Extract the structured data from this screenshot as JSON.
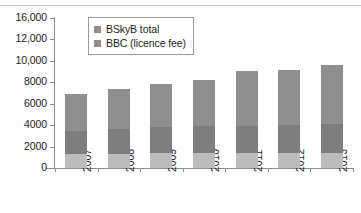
{
  "chart_data": {
    "type": "bar",
    "title": "",
    "subtitle": "",
    "xlabel": "",
    "ylabel": "",
    "stacked": true,
    "grid": false,
    "legend_position": "top-left-inside",
    "ylim": [
      0,
      16000
    ],
    "yticks": [
      0,
      2000,
      4000,
      6000,
      8000,
      10000,
      12000,
      16000
    ],
    "ytick_labels": [
      "0",
      "2000",
      "4000",
      "6000",
      "8000",
      "10,000",
      "12,000",
      "16,000"
    ],
    "categories": [
      "2007",
      "2008",
      "2009",
      "2010",
      "2011",
      "2012",
      "2013"
    ],
    "series": [
      {
        "name": "BBC (licence fee)",
        "color": "#bcbcbc",
        "values": [
          1450,
          1500,
          1550,
          1550,
          1550,
          1550,
          1550
        ]
      },
      {
        "name": "BSkyB total",
        "color": "#7e7e7e",
        "values": [
          2450,
          2700,
          2800,
          2900,
          2950,
          3050,
          3100
        ]
      },
      {
        "name": "remainder",
        "color": "#8f8f8f",
        "values": [
          4000,
          4200,
          4650,
          4950,
          5900,
          5900,
          6350
        ]
      }
    ],
    "totals": [
      7900,
      8400,
      9000,
      9400,
      10400,
      10500,
      11000
    ],
    "legend_entries": [
      "BSkyB total",
      "BBC (licence fee)"
    ]
  },
  "legend": {
    "items": [
      {
        "label": "BSkyB total",
        "color": "#8f8f8f"
      },
      {
        "label": "BBC (licence fee)",
        "color": "#8f8f8f"
      }
    ]
  }
}
